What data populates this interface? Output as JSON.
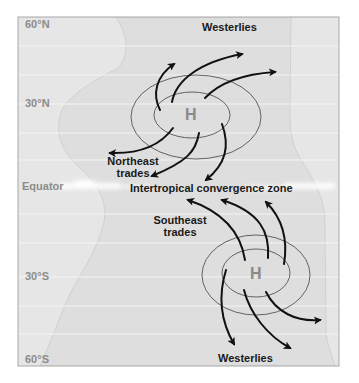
{
  "diagram": {
    "colors": {
      "frame_border": "#a8a8a8",
      "ocean_fill": "#e6e6e6",
      "land_fill": "#dcdcdc",
      "land_edge": "#cfcfcf",
      "gridline": "#f4f4f4",
      "equator_band": "#ffffff",
      "isobar": "#555555",
      "arrow": "#111111",
      "latitude_text": "#8c8c8c",
      "pressure_text": "#8a8a8a",
      "wind_text": "#1a1a1a"
    },
    "latitudes": [
      {
        "label": "60°N",
        "y": 19
      },
      {
        "label": "30°N",
        "y": 98
      },
      {
        "label": "Equator",
        "y": 181
      },
      {
        "label": "30°S",
        "y": 271
      },
      {
        "label": "60°S",
        "y": 353
      }
    ],
    "gridlines_y": [
      46,
      75,
      104,
      133,
      160,
      214,
      243,
      277,
      306,
      334
    ],
    "pressure_systems": [
      {
        "label": "H",
        "hemisphere": "north",
        "cx": 191,
        "cy": 115
      },
      {
        "label": "H",
        "hemisphere": "south",
        "cx": 256,
        "cy": 274
      }
    ],
    "wind_labels": {
      "westerlies_north": "Westerlies",
      "northeast_trades_line1": "Northeast",
      "northeast_trades_line2": "trades",
      "itcz": "Intertropical convergence zone",
      "southeast_trades_line1": "Southeast",
      "southeast_trades_line2": "trades",
      "westerlies_south": "Westerlies"
    }
  }
}
